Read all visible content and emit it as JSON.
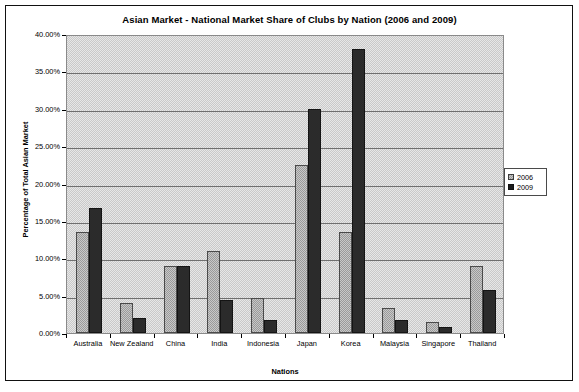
{
  "chart_data": {
    "type": "bar",
    "title": "Asian Market - National Market Share of Clubs by Nation (2006 and 2009)",
    "xlabel": "Nations",
    "ylabel": "Percentage of Total Asian Market",
    "categories": [
      "Australia",
      "New Zealand",
      "China",
      "India",
      "Indonesia",
      "Japan",
      "Korea",
      "Malaysia",
      "Singapore",
      "Thailand"
    ],
    "series": [
      {
        "name": "2006",
        "color": "#9a9a9a",
        "values": [
          13.5,
          4.0,
          9.0,
          11.0,
          4.7,
          22.5,
          13.5,
          3.4,
          1.5,
          9.0
        ]
      },
      {
        "name": "2009",
        "color": "#2b2b2b",
        "values": [
          16.7,
          2.0,
          9.0,
          4.4,
          1.8,
          30.0,
          38.0,
          1.7,
          0.8,
          5.8
        ]
      }
    ],
    "ylim": [
      0,
      40
    ],
    "ytick_values": [
      0,
      5,
      10,
      15,
      20,
      25,
      30,
      35,
      40
    ],
    "ytick_labels": [
      "0.00%",
      "5.00%",
      "10.00%",
      "15.00%",
      "20.00%",
      "25.00%",
      "30.00%",
      "35.00%",
      "40.00%"
    ],
    "grid": true,
    "legend_position": "right",
    "plot_background": "#c9c9c9"
  }
}
